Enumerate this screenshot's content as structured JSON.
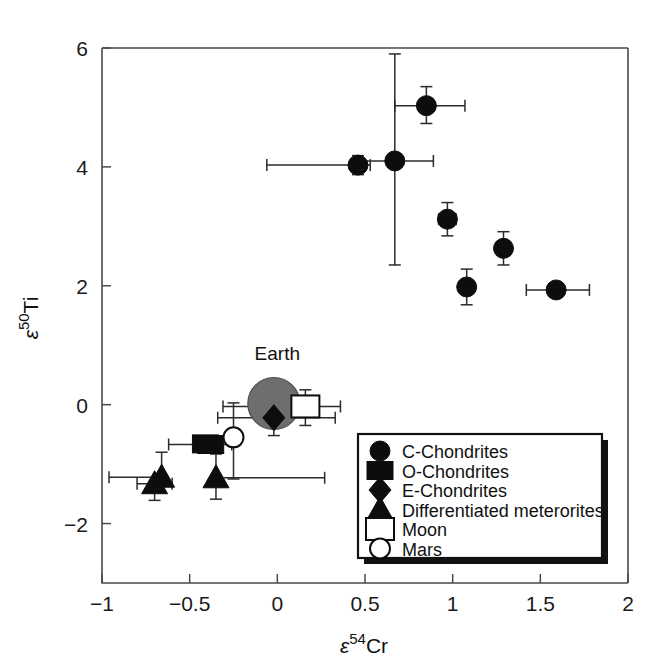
{
  "chart_data": {
    "type": "scatter",
    "title": "",
    "xlabel": "ε⁵⁴Cr",
    "ylabel": "ε⁵⁰Ti",
    "xlabel_parts": {
      "epsilon": "ε",
      "sup": "54",
      "element": "Cr"
    },
    "ylabel_parts": {
      "epsilon": "ε",
      "sup": "50",
      "element": "Ti"
    },
    "xlim": [
      -1,
      2
    ],
    "ylim": [
      -3,
      6
    ],
    "xticks": [
      -1,
      -0.5,
      0,
      0.5,
      1,
      1.5,
      2
    ],
    "xticklabels": [
      "-1",
      "-0.5",
      "0",
      "0.5",
      "1",
      "1.5",
      "2"
    ],
    "yticks": [
      6,
      4,
      2,
      0,
      -2
    ],
    "yticklabels": [
      "6",
      "4",
      "2",
      "0",
      "-2"
    ],
    "grid": false,
    "legend_position": "lower-right",
    "annotations": [
      {
        "text": "Earth",
        "x": 0.0,
        "y": 0.75
      }
    ],
    "series": [
      {
        "name": "C-Chondrites",
        "marker": "circle",
        "fill": "#0d0d0d",
        "points": [
          {
            "x": 0.85,
            "y": 5.03,
            "xerr_low": 0.18,
            "xerr_high": 0.22,
            "yerr_low": 0.3,
            "yerr_high": 0.32
          },
          {
            "x": 0.46,
            "y": 4.03,
            "xerr_low": 0.52,
            "xerr_high": 0.07,
            "yerr_low": 0.16,
            "yerr_high": 0.16
          },
          {
            "x": 0.67,
            "y": 4.1,
            "xerr_low": 0.22,
            "xerr_high": 0.22,
            "yerr_low": 1.75,
            "yerr_high": 1.8
          },
          {
            "x": 0.97,
            "y": 3.12,
            "xerr_low": 0.05,
            "xerr_high": 0.05,
            "yerr_low": 0.28,
            "yerr_high": 0.28
          },
          {
            "x": 1.08,
            "y": 1.98,
            "xerr_low": 0.04,
            "xerr_high": 0.04,
            "yerr_low": 0.3,
            "yerr_high": 0.3
          },
          {
            "x": 1.29,
            "y": 2.63,
            "xerr_low": 0.04,
            "xerr_high": 0.04,
            "yerr_low": 0.28,
            "yerr_high": 0.28
          },
          {
            "x": 1.59,
            "y": 1.93,
            "xerr_low": 0.17,
            "xerr_high": 0.19,
            "yerr_low": 0.0,
            "yerr_high": 0.0
          }
        ]
      },
      {
        "name": "O-Chondrites",
        "marker": "square",
        "fill": "#0d0d0d",
        "points": [
          {
            "x": -0.38,
            "y": -0.67,
            "xerr_low": 0.24,
            "xerr_high": 0.12,
            "yerr_low": 0.0,
            "yerr_high": 0.0
          },
          {
            "x": -0.41,
            "y": -0.66,
            "xerr_low": 0.0,
            "xerr_high": 0.0,
            "yerr_low": 0.0,
            "yerr_high": 0.0
          }
        ]
      },
      {
        "name": "E-Chondrites",
        "marker": "diamond",
        "fill": "#0d0d0d",
        "points": [
          {
            "x": -0.02,
            "y": -0.22,
            "xerr_low": 0.32,
            "xerr_high": 0.35,
            "yerr_low": 0.3,
            "yerr_high": 0.0
          }
        ]
      },
      {
        "name": "Differentiated meterorites",
        "marker": "triangle",
        "fill": "#0d0d0d",
        "points": [
          {
            "x": -0.66,
            "y": -1.22,
            "xerr_low": 0.3,
            "xerr_high": 0.0,
            "yerr_low": 0.0,
            "yerr_high": 0.42
          },
          {
            "x": -0.7,
            "y": -1.33,
            "xerr_low": 0.1,
            "xerr_high": 0.1,
            "yerr_low": 0.28,
            "yerr_high": 0.0
          },
          {
            "x": -0.35,
            "y": -1.23,
            "xerr_low": 0.0,
            "xerr_high": 0.62,
            "yerr_low": 0.36,
            "yerr_high": 0.4
          }
        ]
      },
      {
        "name": "Moon",
        "marker": "square-open",
        "fill": "#ffffff",
        "points": [
          {
            "x": 0.16,
            "y": -0.03,
            "xerr_low": 0.47,
            "xerr_high": 0.2,
            "yerr_low": 0.32,
            "yerr_high": 0.28
          }
        ]
      },
      {
        "name": "Mars",
        "marker": "circle-open",
        "fill": "#ffffff",
        "points": [
          {
            "x": -0.25,
            "y": -0.55,
            "xerr_low": 0.0,
            "xerr_high": 0.0,
            "yerr_low": 0.7,
            "yerr_high": 0.58
          }
        ]
      },
      {
        "name": "Earth",
        "marker": "circle-grey-large",
        "fill": "#6e6e6e",
        "points": [
          {
            "x": -0.02,
            "y": 0.02,
            "xerr_low": 0.0,
            "xerr_high": 0.0,
            "yerr_low": 0.0,
            "yerr_high": 0.0
          }
        ]
      }
    ],
    "legend_entries": [
      {
        "label": "C-Chondrites",
        "marker": "circle"
      },
      {
        "label": "O-Chondrites",
        "marker": "square"
      },
      {
        "label": "E-Chondrites",
        "marker": "diamond"
      },
      {
        "label": "Differentiated meterorites",
        "marker": "triangle"
      },
      {
        "label": "Moon",
        "marker": "square-open"
      },
      {
        "label": "Mars",
        "marker": "circle-open"
      }
    ],
    "colors": {
      "marker_fill": "#0d0d0d",
      "earth_fill": "#6e6e6e",
      "axis": "#4a4a4a",
      "background": "#ffffff"
    }
  }
}
